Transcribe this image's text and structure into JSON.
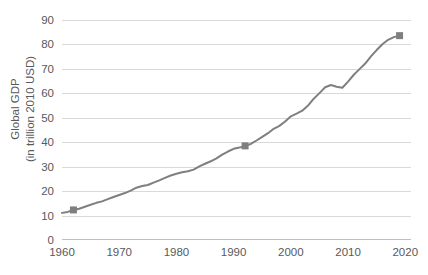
{
  "chart_data": {
    "type": "line",
    "title": "",
    "xlabel": "",
    "ylabel_lines": [
      "Global GDP",
      "(in trillion 2010 USD)"
    ],
    "xlim": [
      1960,
      2021
    ],
    "ylim": [
      0,
      90
    ],
    "grid": true,
    "legend": "none",
    "series_name": "Global GDP",
    "line_color": "#7f7f7f",
    "marker_color": "#7f7f7f",
    "marker_shape": "square",
    "gridline_color": "#d9d9d9",
    "axis_color": "#bfbfbf",
    "text_color": "#58595b",
    "y_ticks": [
      0,
      10,
      20,
      30,
      40,
      50,
      60,
      70,
      80,
      90
    ],
    "x_ticks": [
      1960,
      1970,
      1980,
      1990,
      2000,
      2010,
      2020
    ],
    "x": [
      1960,
      1961,
      1962,
      1963,
      1964,
      1965,
      1966,
      1967,
      1968,
      1969,
      1970,
      1971,
      1972,
      1973,
      1974,
      1975,
      1976,
      1977,
      1978,
      1979,
      1980,
      1981,
      1982,
      1983,
      1984,
      1985,
      1986,
      1987,
      1988,
      1989,
      1990,
      1991,
      1992,
      1993,
      1994,
      1995,
      1996,
      1997,
      1998,
      1999,
      2000,
      2001,
      2002,
      2003,
      2004,
      2005,
      2006,
      2007,
      2008,
      2009,
      2010,
      2011,
      2012,
      2013,
      2014,
      2015,
      2016,
      2017,
      2018,
      2019
    ],
    "y": [
      11.1,
      11.5,
      12.3,
      12.8,
      13.6,
      14.4,
      15.2,
      15.8,
      16.7,
      17.6,
      18.4,
      19.2,
      20.2,
      21.4,
      22.1,
      22.5,
      23.5,
      24.4,
      25.4,
      26.4,
      27.1,
      27.7,
      28.1,
      28.8,
      30.1,
      31.2,
      32.2,
      33.4,
      34.9,
      36.2,
      37.3,
      37.8,
      38.5,
      39.3,
      40.7,
      42.2,
      43.7,
      45.5,
      46.7,
      48.5,
      50.6,
      51.7,
      52.9,
      55.0,
      57.8,
      60.1,
      62.5,
      63.4,
      62.7,
      62.3,
      64.8,
      67.6,
      69.9,
      72.2,
      75.1,
      77.7,
      80.1,
      81.9,
      83.0,
      83.6
    ],
    "markers": [
      {
        "x": 1962,
        "y": 12.3
      },
      {
        "x": 1992,
        "y": 38.5
      },
      {
        "x": 2019,
        "y": 83.6
      }
    ]
  }
}
